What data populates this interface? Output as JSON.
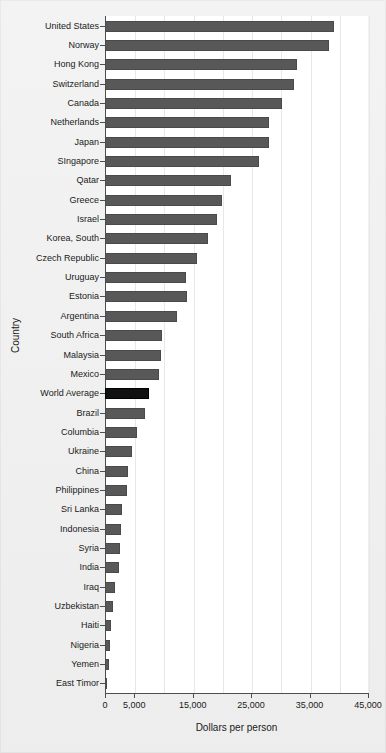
{
  "chart_data": {
    "type": "bar",
    "orientation": "horizontal",
    "title": "",
    "xlabel": "Dollars per person",
    "ylabel": "Country",
    "xlim": [
      0,
      45000
    ],
    "grid": true,
    "legend": null,
    "xticks": [
      0,
      5000,
      15000,
      25000,
      35000,
      45000
    ],
    "xtick_labels": [
      "0",
      "5,000",
      "15,000",
      "25,000",
      "35,000",
      "45,000"
    ],
    "gridlines": [
      0,
      5000,
      10000,
      15000,
      20000,
      25000,
      30000,
      35000,
      40000,
      45000
    ],
    "highlight_category": "World Average",
    "colors": {
      "bar": "#585858",
      "highlight_bar": "#111111",
      "panel_background": "#ffffff",
      "figure_background": "#efefef",
      "gridline": "#e8e8e8",
      "axis": "#4d4d4d",
      "text": "#1a1a1a"
    },
    "categories": [
      "United States",
      "Norway",
      "Hong Kong",
      "Switzerland",
      "Canada",
      "Netherlands",
      "Japan",
      "SIngapore",
      "Qatar",
      "Greece",
      "Israel",
      "Korea, South",
      "Czech Republic",
      "Uruguay",
      "Estonia",
      "Argentina",
      "South Africa",
      "Malaysia",
      "Mexico",
      "World Average",
      "Brazil",
      "Columbia",
      "Ukraine",
      "China",
      "Philippines",
      "Sri Lanka",
      "Indonesia",
      "Syria",
      "India",
      "Iraq",
      "Uzbekistan",
      "Haiti",
      "Nigeria",
      "Yemen",
      "East Timor"
    ],
    "values": [
      39200,
      38300,
      32900,
      32400,
      30200,
      28100,
      28000,
      26400,
      21600,
      20000,
      19200,
      17600,
      15700,
      13900,
      14000,
      12300,
      9800,
      9500,
      9300,
      7500,
      6800,
      5400,
      4700,
      4000,
      3800,
      2900,
      2700,
      2500,
      2400,
      1700,
      1400,
      1000,
      800,
      700,
      350
    ]
  }
}
